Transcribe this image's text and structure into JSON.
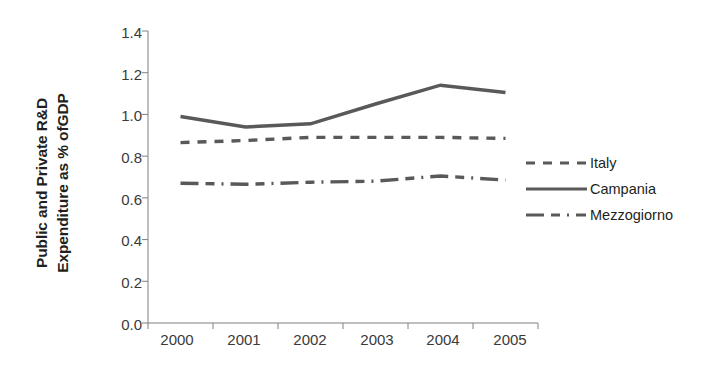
{
  "chart_data": {
    "type": "line",
    "title": "",
    "xlabel": "",
    "ylabel": "Public and Private R&D Expenditure as % ofGDP",
    "ylabel_lines": [
      "Public and Private R&D",
      "Expenditure as % ofGDP"
    ],
    "categories": [
      "2000",
      "2001",
      "2002",
      "2003",
      "2004",
      "2005"
    ],
    "x": [
      2000,
      2001,
      2002,
      2003,
      2004,
      2005
    ],
    "ylim": [
      0.0,
      1.4
    ],
    "ytick_labels": [
      "0.0",
      "0.2",
      "0.4",
      "0.6",
      "0.8",
      "1.0",
      "1.2",
      "1.4"
    ],
    "ytick_values": [
      0.0,
      0.2,
      0.4,
      0.6,
      0.8,
      1.0,
      1.2,
      1.4
    ],
    "grid": false,
    "legend_position": "right",
    "series": [
      {
        "name": "Italy",
        "style": "dashed",
        "color": "#595959",
        "values": [
          0.865,
          0.875,
          0.89,
          0.89,
          0.89,
          0.885
        ]
      },
      {
        "name": "Campania",
        "style": "solid",
        "color": "#595959",
        "values": [
          0.99,
          0.94,
          0.955,
          1.05,
          1.14,
          1.105
        ]
      },
      {
        "name": "Mezzogiorno",
        "style": "dash-dot",
        "color": "#595959",
        "values": [
          0.67,
          0.665,
          0.675,
          0.68,
          0.705,
          0.685
        ]
      }
    ]
  },
  "axis": {
    "line_color": "#808080",
    "tick_color": "#808080",
    "label_color": "#3a3a3a"
  }
}
